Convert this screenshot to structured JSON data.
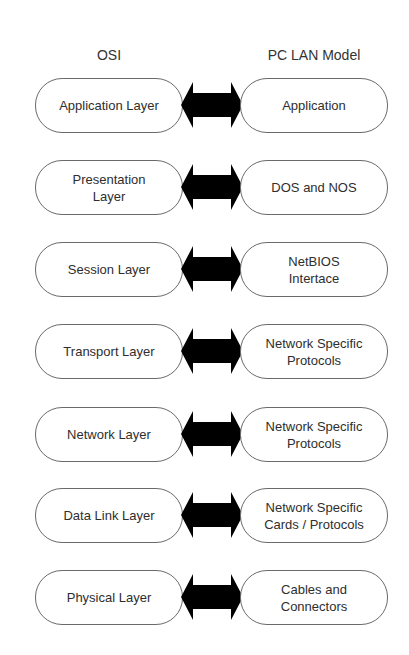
{
  "diagram": {
    "type": "layer-mapping",
    "headers": {
      "left": "OSI",
      "right": "PC LAN Model"
    },
    "arrow_icon": "double-headed-arrow",
    "arrow_color": "#000000",
    "rows": [
      {
        "osi": "Application  Layer",
        "pclan": "Application"
      },
      {
        "osi": "Presentation\nLayer",
        "pclan": "DOS and NOS"
      },
      {
        "osi": "Session Layer",
        "pclan": "NetBIOS\nIntertace"
      },
      {
        "osi": "Transport Layer",
        "pclan": "Network Specific\nProtocols"
      },
      {
        "osi": "Network Layer",
        "pclan": "Network Specific\nProtocols"
      },
      {
        "osi": "Data Link Layer",
        "pclan": "Network Specific\nCards / Protocols"
      },
      {
        "osi": "Physical Layer",
        "pclan": "Cables and\nConnectors"
      }
    ]
  }
}
